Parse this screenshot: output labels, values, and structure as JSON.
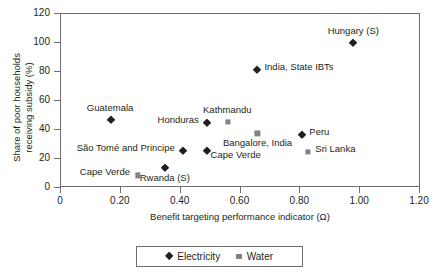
{
  "chart_data": {
    "type": "scatter",
    "title": "",
    "xlabel": "Benefit targeting performance indicator (Ω)",
    "ylabel_line1": "Share of poor households",
    "ylabel_line2": "receiving subsidy (%)",
    "xlim": [
      0,
      1.2
    ],
    "ylim": [
      0,
      120
    ],
    "xticks": [
      "0",
      "0.20",
      "0.40",
      "0.60",
      "0.80",
      "1.00",
      "1.20"
    ],
    "xtick_values": [
      0,
      0.2,
      0.4,
      0.6,
      0.8,
      1.0,
      1.2
    ],
    "yticks": [
      "0",
      "20",
      "40",
      "60",
      "80",
      "100",
      "120"
    ],
    "ytick_values": [
      0,
      20,
      40,
      60,
      80,
      100,
      120
    ],
    "grid": false,
    "legend_position": "bottom-center",
    "series": [
      {
        "name": "Electricity",
        "marker": "diamond",
        "color": "#231f20",
        "points": [
          {
            "label": "Guatemala",
            "x": 0.17,
            "y": 46,
            "label_dx": -1,
            "label_dy": -13,
            "label_align": "center"
          },
          {
            "label": "Honduras",
            "x": 0.49,
            "y": 44,
            "label_dx": -8,
            "label_dy": -4,
            "label_align": "right"
          },
          {
            "label": "São Tomé and Principe",
            "x": 0.41,
            "y": 25,
            "label_dx": -8,
            "label_dy": -4,
            "label_align": "right"
          },
          {
            "label": "Cape Verde",
            "x": 0.49,
            "y": 25,
            "label_dx": 4,
            "label_dy": 3,
            "label_align": "left"
          },
          {
            "label": "Rwanda (S)",
            "x": 0.35,
            "y": 13,
            "label_dx": 0,
            "label_dy": 9,
            "label_align": "center"
          },
          {
            "label": "India, State IBTs",
            "x": 0.66,
            "y": 81,
            "label_dx": 7,
            "label_dy": -4,
            "label_align": "left"
          },
          {
            "label": "Hungary (S)",
            "x": 0.98,
            "y": 99,
            "label_dx": 0,
            "label_dy": -13,
            "label_align": "center"
          },
          {
            "label": "Peru",
            "x": 0.81,
            "y": 36,
            "label_dx": 7,
            "label_dy": -4,
            "label_align": "left"
          }
        ]
      },
      {
        "name": "Water",
        "marker": "square",
        "color": "#808285",
        "points": [
          {
            "label": "Kathmandu",
            "x": 0.56,
            "y": 45,
            "label_dx": 0,
            "label_dy": -13,
            "label_align": "center"
          },
          {
            "label": "Bangalore, India",
            "x": 0.66,
            "y": 37,
            "label_dx": 0,
            "label_dy": 9,
            "label_align": "center"
          },
          {
            "label": "Sri Lanka",
            "x": 0.83,
            "y": 24,
            "label_dx": 7,
            "label_dy": -4,
            "label_align": "left"
          },
          {
            "label": "Cape Verde",
            "x": 0.26,
            "y": 8,
            "label_dx": -8,
            "label_dy": -4,
            "label_align": "right"
          }
        ]
      }
    ],
    "legend": [
      {
        "label": "Electricity",
        "marker": "diamond",
        "color": "#231f20"
      },
      {
        "label": "Water",
        "marker": "square",
        "color": "#808285"
      }
    ]
  }
}
